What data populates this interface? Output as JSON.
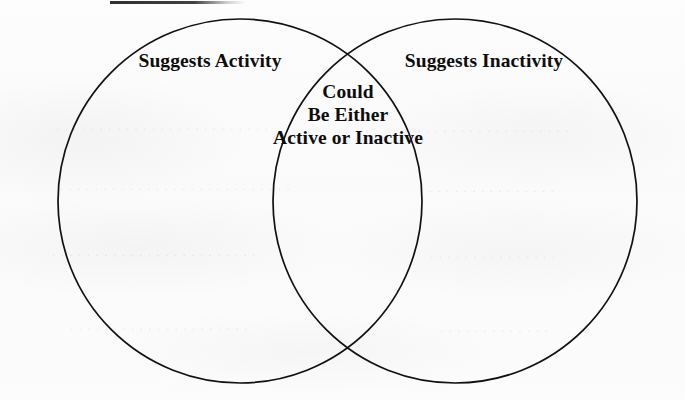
{
  "diagram": {
    "type": "venn",
    "title_rule_present": true,
    "background_color": "#fcfcfc",
    "stroke_color": "#111111",
    "text_color": "#0d0d0d",
    "left_circle": {
      "label": "Suggests Activity",
      "center_x": 240,
      "center_y": 201,
      "radius": 182
    },
    "right_circle": {
      "label": "Suggests Inactivity",
      "center_x": 455,
      "center_y": 201,
      "radius": 182
    },
    "intersection": {
      "line_1": "Could",
      "line_2": "Be Either",
      "line_3": "Active or Inactive",
      "center_x": 348,
      "upper_point_y": 47,
      "lower_point_y": 357
    }
  }
}
